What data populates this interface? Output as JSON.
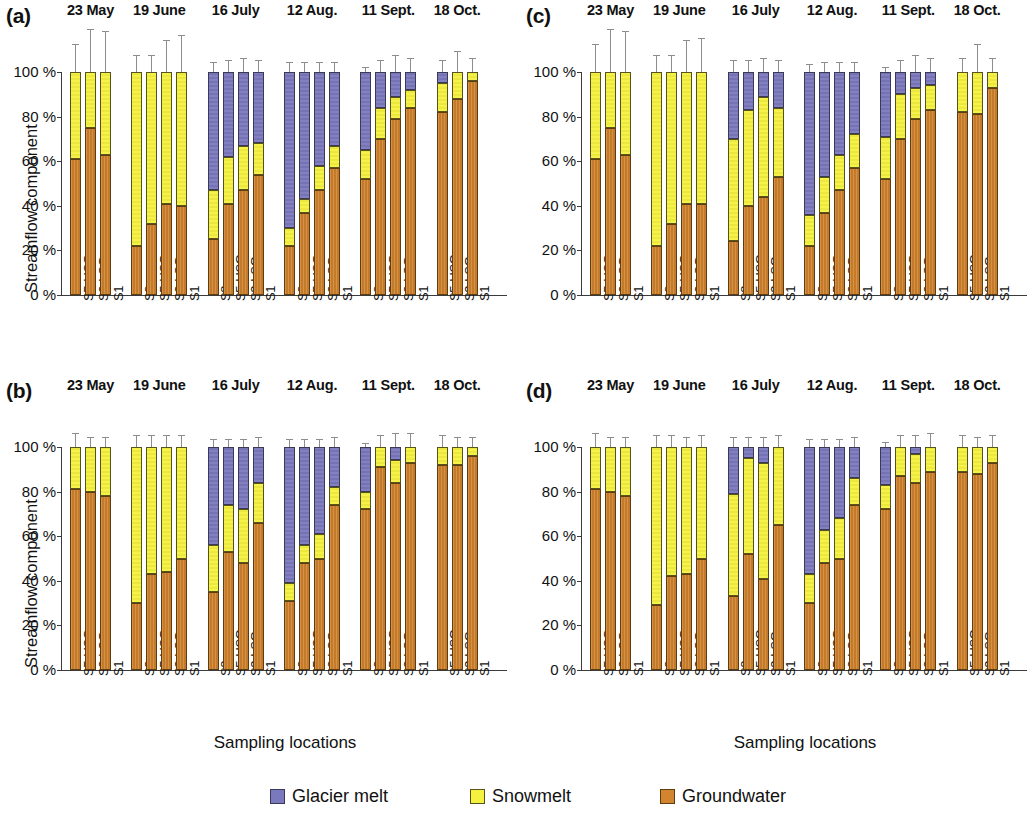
{
  "figure": {
    "legend": [
      {
        "key": "glacier",
        "label": "Glacier melt",
        "color": "#7b79bd"
      },
      {
        "key": "snow",
        "label": "Snowmelt",
        "color": "#f5f13f"
      },
      {
        "key": "gw",
        "label": "Groundwater",
        "color": "#d2842e"
      }
    ],
    "axis": {
      "ylabel": "Streamflow component",
      "xlabel": "Sampling locations",
      "yticks": [
        "0 %",
        "20 %",
        "40 %",
        "60 %",
        "80 %",
        "100 %"
      ],
      "ylim": [
        0,
        100
      ]
    },
    "dates": [
      "23 May",
      "19 June",
      "16 July",
      "12 Aug.",
      "11 Sept.",
      "18 Oct."
    ],
    "panel_tags": [
      "(a)",
      "(b)",
      "(c)",
      "(d)"
    ]
  },
  "chart_data": [
    {
      "type": "bar",
      "panel": "(a)",
      "title": "",
      "xlabel": "Sampling locations",
      "ylabel": "Streamflow component",
      "ylim": [
        0,
        100
      ],
      "grid": false,
      "legend_position": "bottom",
      "stacked": true,
      "series": [
        {
          "name": "Groundwater",
          "color": "#d2842e"
        },
        {
          "name": "Snowmelt",
          "color": "#f5f13f"
        },
        {
          "name": "Glacier melt",
          "color": "#7b79bd"
        }
      ],
      "groups": [
        {
          "date": "23 May",
          "bars": [
            {
              "location": "S5-USG",
              "gw": 61,
              "snow": 39,
              "glacier": 0,
              "err": 12
            },
            {
              "location": "S3-LSG",
              "gw": 75,
              "snow": 25,
              "glacier": 0,
              "err": 19
            },
            {
              "location": "S1",
              "gw": 63,
              "snow": 37,
              "glacier": 0,
              "err": 18
            }
          ]
        },
        {
          "date": "19 June",
          "bars": [
            {
              "location": "S8",
              "gw": 22,
              "snow": 78,
              "glacier": 0,
              "err": 7
            },
            {
              "location": "S5-USG",
              "gw": 32,
              "snow": 68,
              "glacier": 0,
              "err": 7
            },
            {
              "location": "S3-LSG",
              "gw": 41,
              "snow": 59,
              "glacier": 0,
              "err": 14
            },
            {
              "location": "S1",
              "gw": 40,
              "snow": 60,
              "glacier": 0,
              "err": 16
            }
          ]
        },
        {
          "date": "16 July",
          "bars": [
            {
              "location": "S8",
              "gw": 25,
              "snow": 22,
              "glacier": 53,
              "err": 4
            },
            {
              "location": "S5-USG",
              "gw": 41,
              "snow": 21,
              "glacier": 38,
              "err": 5
            },
            {
              "location": "S3-LSG",
              "gw": 47,
              "snow": 20,
              "glacier": 33,
              "err": 6
            },
            {
              "location": "S1",
              "gw": 54,
              "snow": 14,
              "glacier": 32,
              "err": 5
            }
          ]
        },
        {
          "date": "12 Aug.",
          "bars": [
            {
              "location": "S8",
              "gw": 22,
              "snow": 8,
              "glacier": 70,
              "err": 4
            },
            {
              "location": "S5-USG",
              "gw": 37,
              "snow": 6,
              "glacier": 57,
              "err": 4
            },
            {
              "location": "S3-LSG",
              "gw": 47,
              "snow": 11,
              "glacier": 42,
              "err": 4
            },
            {
              "location": "S1",
              "gw": 57,
              "snow": 10,
              "glacier": 33,
              "err": 4
            }
          ]
        },
        {
          "date": "11 Sept.",
          "bars": [
            {
              "location": "S8",
              "gw": 52,
              "snow": 13,
              "glacier": 35,
              "err": 2
            },
            {
              "location": "S5-USG",
              "gw": 70,
              "snow": 14,
              "glacier": 16,
              "err": 5
            },
            {
              "location": "S3-LSG",
              "gw": 79,
              "snow": 10,
              "glacier": 11,
              "err": 7
            },
            {
              "location": "S1",
              "gw": 84,
              "snow": 8,
              "glacier": 8,
              "err": 6
            }
          ]
        },
        {
          "date": "18 Oct.",
          "bars": [
            {
              "location": "S5-USG",
              "gw": 82,
              "snow": 13,
              "glacier": 5,
              "err": 5
            },
            {
              "location": "S3-LSG",
              "gw": 88,
              "snow": 12,
              "glacier": 0,
              "err": 9
            },
            {
              "location": "S1",
              "gw": 96,
              "snow": 4,
              "glacier": 0,
              "err": 6
            }
          ]
        }
      ]
    },
    {
      "type": "bar",
      "panel": "(b)",
      "title": "",
      "xlabel": "Sampling locations",
      "ylabel": "Streamflow component",
      "ylim": [
        0,
        100
      ],
      "grid": false,
      "legend_position": "bottom",
      "stacked": true,
      "series": [
        {
          "name": "Groundwater",
          "color": "#d2842e"
        },
        {
          "name": "Snowmelt",
          "color": "#f5f13f"
        },
        {
          "name": "Glacier melt",
          "color": "#7b79bd"
        }
      ],
      "groups": [
        {
          "date": "23 May",
          "bars": [
            {
              "location": "S5-USG",
              "gw": 81,
              "snow": 19,
              "glacier": 0,
              "err": 6
            },
            {
              "location": "S3-LSG",
              "gw": 80,
              "snow": 20,
              "glacier": 0,
              "err": 4
            },
            {
              "location": "S1",
              "gw": 78,
              "snow": 22,
              "glacier": 0,
              "err": 4
            }
          ]
        },
        {
          "date": "19 June",
          "bars": [
            {
              "location": "S8",
              "gw": 30,
              "snow": 70,
              "glacier": 0,
              "err": 5
            },
            {
              "location": "S5-USG",
              "gw": 43,
              "snow": 57,
              "glacier": 0,
              "err": 5
            },
            {
              "location": "S3-LSG",
              "gw": 44,
              "snow": 56,
              "glacier": 0,
              "err": 5
            },
            {
              "location": "S1",
              "gw": 50,
              "snow": 50,
              "glacier": 0,
              "err": 5
            }
          ]
        },
        {
          "date": "16 July",
          "bars": [
            {
              "location": "S8",
              "gw": 35,
              "snow": 21,
              "glacier": 44,
              "err": 3
            },
            {
              "location": "S5-USG",
              "gw": 53,
              "snow": 21,
              "glacier": 26,
              "err": 3
            },
            {
              "location": "S3-LSG",
              "gw": 48,
              "snow": 24,
              "glacier": 28,
              "err": 3
            },
            {
              "location": "S1",
              "gw": 66,
              "snow": 18,
              "glacier": 16,
              "err": 4
            }
          ]
        },
        {
          "date": "12 Aug.",
          "bars": [
            {
              "location": "S8",
              "gw": 31,
              "snow": 8,
              "glacier": 61,
              "err": 3
            },
            {
              "location": "S5-USG",
              "gw": 48,
              "snow": 8,
              "glacier": 44,
              "err": 3
            },
            {
              "location": "S3-LSG",
              "gw": 50,
              "snow": 11,
              "glacier": 39,
              "err": 3
            },
            {
              "location": "S1",
              "gw": 74,
              "snow": 8,
              "glacier": 18,
              "err": 4
            }
          ]
        },
        {
          "date": "11 Sept.",
          "bars": [
            {
              "location": "S8",
              "gw": 72,
              "snow": 8,
              "glacier": 20,
              "err": 1
            },
            {
              "location": "S5-USG",
              "gw": 91,
              "snow": 9,
              "glacier": 0,
              "err": 5
            },
            {
              "location": "S3-LSG",
              "gw": 84,
              "snow": 10,
              "glacier": 6,
              "err": 6
            },
            {
              "location": "S1",
              "gw": 93,
              "snow": 7,
              "glacier": 0,
              "err": 6
            }
          ]
        },
        {
          "date": "18 Oct.",
          "bars": [
            {
              "location": "S5-USG",
              "gw": 92,
              "snow": 8,
              "glacier": 0,
              "err": 5
            },
            {
              "location": "S3-LSG",
              "gw": 92,
              "snow": 8,
              "glacier": 0,
              "err": 4
            },
            {
              "location": "S1",
              "gw": 96,
              "snow": 4,
              "glacier": 0,
              "err": 4
            }
          ]
        }
      ]
    },
    {
      "type": "bar",
      "panel": "(c)",
      "title": "",
      "xlabel": "Sampling locations",
      "ylabel": "",
      "ylim": [
        0,
        100
      ],
      "grid": false,
      "legend_position": "bottom",
      "stacked": true,
      "series": [
        {
          "name": "Groundwater",
          "color": "#d2842e"
        },
        {
          "name": "Snowmelt",
          "color": "#f5f13f"
        },
        {
          "name": "Glacier melt",
          "color": "#7b79bd"
        }
      ],
      "groups": [
        {
          "date": "23 May",
          "bars": [
            {
              "location": "S5-USG",
              "gw": 61,
              "snow": 39,
              "glacier": 0,
              "err": 12
            },
            {
              "location": "S3-LSG",
              "gw": 75,
              "snow": 25,
              "glacier": 0,
              "err": 19
            },
            {
              "location": "S1",
              "gw": 63,
              "snow": 37,
              "glacier": 0,
              "err": 18
            }
          ]
        },
        {
          "date": "19 June",
          "bars": [
            {
              "location": "S8",
              "gw": 22,
              "snow": 78,
              "glacier": 0,
              "err": 7
            },
            {
              "location": "S5-USG",
              "gw": 32,
              "snow": 68,
              "glacier": 0,
              "err": 7
            },
            {
              "location": "S3-LSG",
              "gw": 41,
              "snow": 59,
              "glacier": 0,
              "err": 14
            },
            {
              "location": "S1",
              "gw": 41,
              "snow": 59,
              "glacier": 0,
              "err": 15
            }
          ]
        },
        {
          "date": "16 July",
          "bars": [
            {
              "location": "S8",
              "gw": 24,
              "snow": 46,
              "glacier": 30,
              "err": 5
            },
            {
              "location": "S5-USG",
              "gw": 40,
              "snow": 43,
              "glacier": 17,
              "err": 5
            },
            {
              "location": "S3-LSG",
              "gw": 44,
              "snow": 45,
              "glacier": 11,
              "err": 6
            },
            {
              "location": "S1",
              "gw": 53,
              "snow": 31,
              "glacier": 16,
              "err": 5
            }
          ]
        },
        {
          "date": "12 Aug.",
          "bars": [
            {
              "location": "S8",
              "gw": 22,
              "snow": 14,
              "glacier": 64,
              "err": 3
            },
            {
              "location": "S5-USG",
              "gw": 37,
              "snow": 16,
              "glacier": 47,
              "err": 4
            },
            {
              "location": "S3-LSG",
              "gw": 47,
              "snow": 16,
              "glacier": 37,
              "err": 4
            },
            {
              "location": "S1",
              "gw": 57,
              "snow": 15,
              "glacier": 28,
              "err": 4
            }
          ]
        },
        {
          "date": "11 Sept.",
          "bars": [
            {
              "location": "S8",
              "gw": 52,
              "snow": 19,
              "glacier": 29,
              "err": 2
            },
            {
              "location": "S5-USG",
              "gw": 70,
              "snow": 20,
              "glacier": 10,
              "err": 5
            },
            {
              "location": "S3-LSG",
              "gw": 79,
              "snow": 14,
              "glacier": 7,
              "err": 7
            },
            {
              "location": "S1",
              "gw": 83,
              "snow": 11,
              "glacier": 6,
              "err": 6
            }
          ]
        },
        {
          "date": "18 Oct.",
          "bars": [
            {
              "location": "S5-USG",
              "gw": 82,
              "snow": 18,
              "glacier": 0,
              "err": 6
            },
            {
              "location": "S3-LSG",
              "gw": 81,
              "snow": 19,
              "glacier": 0,
              "err": 12
            },
            {
              "location": "S1",
              "gw": 93,
              "snow": 7,
              "glacier": 0,
              "err": 6
            }
          ]
        }
      ]
    },
    {
      "type": "bar",
      "panel": "(d)",
      "title": "",
      "xlabel": "Sampling locations",
      "ylabel": "",
      "ylim": [
        0,
        100
      ],
      "grid": false,
      "legend_position": "bottom",
      "stacked": true,
      "series": [
        {
          "name": "Groundwater",
          "color": "#d2842e"
        },
        {
          "name": "Snowmelt",
          "color": "#f5f13f"
        },
        {
          "name": "Glacier melt",
          "color": "#7b79bd"
        }
      ],
      "groups": [
        {
          "date": "23 May",
          "bars": [
            {
              "location": "S5-USG",
              "gw": 81,
              "snow": 19,
              "glacier": 0,
              "err": 6
            },
            {
              "location": "S3-LSG",
              "gw": 80,
              "snow": 20,
              "glacier": 0,
              "err": 4
            },
            {
              "location": "S1",
              "gw": 78,
              "snow": 22,
              "glacier": 0,
              "err": 4
            }
          ]
        },
        {
          "date": "19 June",
          "bars": [
            {
              "location": "S8",
              "gw": 29,
              "snow": 71,
              "glacier": 0,
              "err": 5
            },
            {
              "location": "S5-USG",
              "gw": 42,
              "snow": 58,
              "glacier": 0,
              "err": 5
            },
            {
              "location": "S3-LSG",
              "gw": 43,
              "snow": 57,
              "glacier": 0,
              "err": 4
            },
            {
              "location": "S1",
              "gw": 50,
              "snow": 50,
              "glacier": 0,
              "err": 5
            }
          ]
        },
        {
          "date": "16 July",
          "bars": [
            {
              "location": "S8",
              "gw": 33,
              "snow": 46,
              "glacier": 21,
              "err": 4
            },
            {
              "location": "S5-USG",
              "gw": 52,
              "snow": 43,
              "glacier": 5,
              "err": 4
            },
            {
              "location": "S3-LSG",
              "gw": 41,
              "snow": 52,
              "glacier": 7,
              "err": 4
            },
            {
              "location": "S1",
              "gw": 65,
              "snow": 35,
              "glacier": 0,
              "err": 5
            }
          ]
        },
        {
          "date": "12 Aug.",
          "bars": [
            {
              "location": "S8",
              "gw": 30,
              "snow": 13,
              "glacier": 57,
              "err": 3
            },
            {
              "location": "S5-USG",
              "gw": 48,
              "snow": 15,
              "glacier": 37,
              "err": 3
            },
            {
              "location": "S3-LSG",
              "gw": 50,
              "snow": 18,
              "glacier": 32,
              "err": 3
            },
            {
              "location": "S1",
              "gw": 74,
              "snow": 12,
              "glacier": 14,
              "err": 4
            }
          ]
        },
        {
          "date": "11 Sept.",
          "bars": [
            {
              "location": "S8",
              "gw": 72,
              "snow": 11,
              "glacier": 17,
              "err": 2
            },
            {
              "location": "S5-USG",
              "gw": 87,
              "snow": 13,
              "glacier": 0,
              "err": 5
            },
            {
              "location": "S3-LSG",
              "gw": 84,
              "snow": 13,
              "glacier": 3,
              "err": 5
            },
            {
              "location": "S1",
              "gw": 89,
              "snow": 11,
              "glacier": 0,
              "err": 6
            }
          ]
        },
        {
          "date": "18 Oct.",
          "bars": [
            {
              "location": "S5-USG",
              "gw": 89,
              "snow": 11,
              "glacier": 0,
              "err": 5
            },
            {
              "location": "S3-LSG",
              "gw": 88,
              "snow": 12,
              "glacier": 0,
              "err": 4
            },
            {
              "location": "S1",
              "gw": 93,
              "snow": 7,
              "glacier": 0,
              "err": 5
            }
          ]
        }
      ]
    }
  ]
}
